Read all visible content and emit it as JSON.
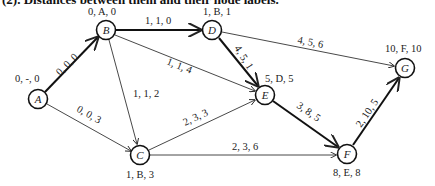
{
  "caption": "(2). Distances between them and their node labels.",
  "nodes": [
    {
      "id": "A",
      "label": "0, -, 0",
      "x": 38,
      "y": 99
    },
    {
      "id": "B",
      "label": "0, A, 0",
      "x": 106,
      "y": 30
    },
    {
      "id": "C",
      "label": "1, B, 3",
      "x": 140,
      "y": 155
    },
    {
      "id": "D",
      "label": "1, B, 1",
      "x": 212,
      "y": 30
    },
    {
      "id": "E",
      "label": "5, D, 5",
      "x": 265,
      "y": 95
    },
    {
      "id": "F",
      "label": "8, E, 8",
      "x": 347,
      "y": 154
    },
    {
      "id": "G",
      "label": "10, F, 10",
      "x": 405,
      "y": 68
    }
  ],
  "edges": [
    {
      "from": "A",
      "to": "B",
      "label": "0, 0, 0",
      "bold": true
    },
    {
      "from": "A",
      "to": "C",
      "label": "0, 0, 3",
      "bold": false
    },
    {
      "from": "B",
      "to": "D",
      "label": "1, 1, 0",
      "bold": true
    },
    {
      "from": "B",
      "to": "C",
      "label": "1, 1, 2",
      "bold": false
    },
    {
      "from": "B",
      "to": "E",
      "label": "1, 1, 4",
      "bold": false
    },
    {
      "from": "D",
      "to": "E",
      "label": "4, 5, 1",
      "bold": true
    },
    {
      "from": "D",
      "to": "G",
      "label": "4, 5, 6",
      "bold": false
    },
    {
      "from": "C",
      "to": "E",
      "label": "2, 3, 3",
      "bold": false
    },
    {
      "from": "C",
      "to": "F",
      "label": "2, 3, 6",
      "bold": false
    },
    {
      "from": "E",
      "to": "F",
      "label": "3, 8, 5",
      "bold": true
    },
    {
      "from": "F",
      "to": "G",
      "label": "2, 10, 5",
      "bold": true
    }
  ]
}
